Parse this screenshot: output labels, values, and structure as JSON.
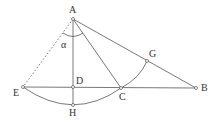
{
  "diagram": {
    "type": "geometry",
    "colors": {
      "line": "#555555",
      "text": "#333333",
      "background": "#ffffff"
    },
    "points": [
      {
        "id": "A",
        "label": "A",
        "x": 73,
        "y": 19
      },
      {
        "id": "E",
        "label": "E",
        "x": 23,
        "y": 87
      },
      {
        "id": "D",
        "label": "D",
        "x": 73,
        "y": 87
      },
      {
        "id": "H",
        "label": "H",
        "x": 73,
        "y": 105
      },
      {
        "id": "C",
        "label": "C",
        "x": 121,
        "y": 88
      },
      {
        "id": "G",
        "label": "G",
        "x": 147,
        "y": 61
      },
      {
        "id": "B",
        "label": "B",
        "x": 196,
        "y": 88
      }
    ],
    "angle_label": "α"
  }
}
